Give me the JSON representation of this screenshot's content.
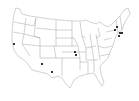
{
  "map": {
    "region": "Contiguous United States",
    "style": "state outlines, white fill, gray borders",
    "colors": {
      "background": "#ffffff",
      "border": "#9a9a9a",
      "marker": "#333333"
    },
    "markers": [
      {
        "name": "marker-san-francisco",
        "x": 14,
        "y": 44
      },
      {
        "name": "marker-arizona",
        "x": 42,
        "y": 64
      },
      {
        "name": "marker-el-paso",
        "x": 52,
        "y": 72
      },
      {
        "name": "marker-kansas-city-1",
        "x": 75,
        "y": 52
      },
      {
        "name": "marker-kansas-city-2",
        "x": 76,
        "y": 55
      },
      {
        "name": "marker-northeast-1",
        "x": 117,
        "y": 27
      },
      {
        "name": "marker-northeast-2",
        "x": 115,
        "y": 30
      },
      {
        "name": "marker-northeast-3",
        "x": 120,
        "y": 33
      },
      {
        "name": "marker-northeast-4",
        "x": 122,
        "y": 33
      },
      {
        "name": "marker-northeast-5",
        "x": 119,
        "y": 36
      }
    ]
  }
}
